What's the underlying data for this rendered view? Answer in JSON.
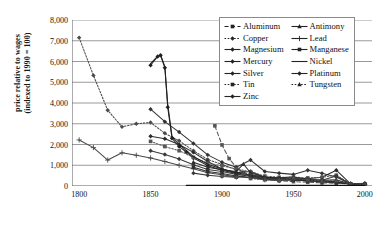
{
  "chart_data": {
    "type": "line",
    "title": "",
    "xlabel": "",
    "ylabel": "price relative to wages (indexed to 1990 = 100)",
    "ylabel_line1": "price relative to wages",
    "ylabel_line2": "(indexed to 1990 = 100)",
    "xlim": [
      1795,
      2005
    ],
    "ylim": [
      0,
      8000
    ],
    "xticks": [
      1800,
      1850,
      1900,
      1950,
      2000
    ],
    "xticklabels": [
      "1800",
      "1850",
      "1900",
      "1950",
      "2000"
    ],
    "yticks": [
      0,
      1000,
      2000,
      3000,
      4000,
      5000,
      6000,
      7000,
      8000
    ],
    "yticklabels": [
      "0",
      "1,000",
      "2,000",
      "3,000",
      "4,000",
      "5,000",
      "6,000",
      "7,000",
      "8,000"
    ],
    "grid": "horizontal",
    "legend_position": "upper-right-inside",
    "series": [
      {
        "name": "Aluminum",
        "marker": "square",
        "dash": "dashed",
        "color": "#555555",
        "x": [
          1895,
          1900,
          1905,
          1910,
          1915,
          1920,
          1930,
          1940,
          1950,
          1960,
          1970,
          1980,
          1990,
          2000
        ],
        "y": [
          2900,
          1980,
          1320,
          900,
          640,
          470,
          330,
          250,
          210,
          180,
          150,
          130,
          100,
          85
        ]
      },
      {
        "name": "Copper",
        "marker": "diamond",
        "dash": "dotted",
        "color": "#4a4a4a",
        "x": [
          1800,
          1810,
          1820,
          1830,
          1840,
          1850,
          1860,
          1870,
          1880,
          1890,
          1900,
          1910,
          1920,
          1930,
          1940,
          1950,
          1960,
          1970,
          1980,
          1990,
          2000
        ],
        "y": [
          7150,
          5330,
          3650,
          2850,
          3000,
          3060,
          2540,
          2180,
          1700,
          1280,
          1040,
          780,
          540,
          430,
          360,
          330,
          300,
          280,
          190,
          100,
          90
        ]
      },
      {
        "name": "Magnesium",
        "marker": "diamond",
        "dash": "solid",
        "color": "#222222",
        "x": [
          1850,
          1855,
          1857,
          1860,
          1862,
          1865,
          1870,
          1875,
          1880,
          1890,
          1900,
          1910,
          1920,
          1930,
          1940,
          1950,
          1960,
          1970,
          1980,
          1990,
          2000
        ],
        "y": [
          5820,
          6240,
          6300,
          5700,
          3800,
          2300,
          1900,
          1640,
          1350,
          980,
          760,
          600,
          480,
          400,
          330,
          290,
          250,
          210,
          170,
          100,
          95
        ]
      },
      {
        "name": "Mercury",
        "marker": "diamond",
        "dash": "solid",
        "color": "#333333",
        "x": [
          1850,
          1860,
          1870,
          1880,
          1890,
          1900,
          1910,
          1920,
          1930,
          1940,
          1950,
          1960,
          1970,
          1980,
          1990,
          2000
        ],
        "y": [
          3700,
          3100,
          2600,
          2050,
          1500,
          1150,
          900,
          1250,
          700,
          620,
          560,
          760,
          610,
          430,
          100,
          80
        ]
      },
      {
        "name": "Silver",
        "marker": "diamond",
        "dash": "solid",
        "color": "#2b2b2b",
        "x": [
          1850,
          1860,
          1870,
          1880,
          1890,
          1900,
          1910,
          1920,
          1930,
          1940,
          1950,
          1960,
          1970,
          1980,
          1990,
          2000
        ],
        "y": [
          2400,
          2280,
          2000,
          1620,
          1180,
          820,
          640,
          700,
          420,
          330,
          380,
          350,
          420,
          760,
          100,
          110
        ]
      },
      {
        "name": "Tin",
        "marker": "square",
        "dash": "dotted",
        "color": "#555555",
        "x": [
          1850,
          1860,
          1870,
          1880,
          1890,
          1900,
          1910,
          1920,
          1930,
          1940,
          1950,
          1960,
          1970,
          1980,
          1990,
          2000
        ],
        "y": [
          2150,
          1900,
          1700,
          1380,
          1100,
          980,
          820,
          690,
          480,
          420,
          430,
          390,
          420,
          520,
          100,
          70
        ]
      },
      {
        "name": "Zinc",
        "marker": "diamond",
        "dash": "solid",
        "color": "#3a3a3a",
        "x": [
          1850,
          1860,
          1870,
          1880,
          1890,
          1900,
          1910,
          1920,
          1930,
          1940,
          1950,
          1960,
          1970,
          1980,
          1990,
          2000
        ],
        "y": [
          1700,
          1520,
          1300,
          1020,
          800,
          700,
          560,
          500,
          330,
          300,
          330,
          270,
          230,
          200,
          100,
          85
        ]
      },
      {
        "name": "Antimony",
        "marker": "triangle",
        "dash": "solid",
        "color": "#2d2d2d",
        "x": [
          1880,
          1890,
          1900,
          1910,
          1915,
          1920,
          1930,
          1940,
          1950,
          1960,
          1970,
          1980,
          1990,
          2000
        ],
        "y": [
          1150,
          900,
          780,
          700,
          1050,
          640,
          420,
          400,
          430,
          330,
          280,
          300,
          100,
          75
        ]
      },
      {
        "name": "Lead",
        "marker": "plus",
        "dash": "solid",
        "color": "#4a4a4a",
        "x": [
          1800,
          1810,
          1820,
          1830,
          1840,
          1850,
          1860,
          1870,
          1880,
          1890,
          1900,
          1910,
          1920,
          1930,
          1940,
          1950,
          1960,
          1970,
          1980,
          1990,
          2000
        ],
        "y": [
          2220,
          1850,
          1250,
          1600,
          1480,
          1350,
          1180,
          1000,
          830,
          640,
          540,
          440,
          400,
          300,
          260,
          300,
          230,
          200,
          170,
          100,
          80
        ]
      },
      {
        "name": "Manganese",
        "marker": "square",
        "dash": "solid",
        "color": "#303030",
        "x": [
          1880,
          1890,
          1900,
          1910,
          1920,
          1930,
          1940,
          1950,
          1960,
          1970,
          1980,
          1990,
          2000
        ],
        "y": [
          900,
          700,
          600,
          480,
          420,
          330,
          290,
          290,
          250,
          210,
          180,
          100,
          80
        ]
      },
      {
        "name": "Nickel",
        "marker": "none",
        "dash": "solid",
        "color": "#222222",
        "x": [
          1850,
          1855,
          1857,
          1860,
          1862,
          1865,
          1870,
          1875,
          1880,
          1890,
          1900,
          1910,
          1920,
          1930,
          1940,
          1950,
          1960,
          1970,
          1980,
          1990,
          2000
        ],
        "y": [
          5900,
          6260,
          6320,
          5750,
          3950,
          2400,
          2000,
          1720,
          1420,
          1050,
          820,
          640,
          520,
          430,
          360,
          320,
          280,
          240,
          190,
          100,
          100
        ]
      },
      {
        "name": "Platinum",
        "marker": "diamond",
        "dash": "solid",
        "color": "#383838",
        "x": [
          1880,
          1890,
          1900,
          1910,
          1920,
          1930,
          1940,
          1950,
          1960,
          1970,
          1980,
          1990,
          2000
        ],
        "y": [
          620,
          520,
          460,
          420,
          560,
          380,
          320,
          330,
          300,
          280,
          480,
          100,
          130
        ]
      },
      {
        "name": "Tungsten",
        "marker": "triangle",
        "dash": "dotted",
        "color": "#4f4f4f",
        "x": [
          1900,
          1910,
          1915,
          1920,
          1930,
          1940,
          1950,
          1960,
          1970,
          1980,
          1990,
          2000
        ],
        "y": [
          500,
          420,
          620,
          360,
          300,
          280,
          400,
          300,
          240,
          260,
          100,
          70
        ]
      },
      {
        "name": "Baseline",
        "marker": "none",
        "dash": "solid",
        "color": "#111111",
        "x": [
          1875,
          1890,
          1900,
          1920,
          1940,
          1960,
          1980,
          2000
        ],
        "y": [
          30,
          30,
          30,
          30,
          30,
          30,
          30,
          30
        ]
      }
    ]
  },
  "legend": {
    "items": [
      {
        "label": "Aluminum",
        "marker": "square",
        "dash": "dashed"
      },
      {
        "label": "Antimony",
        "marker": "triangle",
        "dash": "solid"
      },
      {
        "label": "Copper",
        "marker": "diamond",
        "dash": "dotted"
      },
      {
        "label": "Lead",
        "marker": "plus",
        "dash": "solid"
      },
      {
        "label": "Magnesium",
        "marker": "diamond",
        "dash": "solid"
      },
      {
        "label": "Manganese",
        "marker": "square",
        "dash": "solid"
      },
      {
        "label": "Mercury",
        "marker": "diamond",
        "dash": "solid"
      },
      {
        "label": "Nickel",
        "marker": "none",
        "dash": "solid"
      },
      {
        "label": "Silver",
        "marker": "diamond",
        "dash": "solid"
      },
      {
        "label": "Platinum",
        "marker": "diamond",
        "dash": "solid"
      },
      {
        "label": "Tin",
        "marker": "square",
        "dash": "dotted"
      },
      {
        "label": "Tungsten",
        "marker": "triangle",
        "dash": "dotted"
      },
      {
        "label": "Zinc",
        "marker": "diamond",
        "dash": "solid"
      }
    ]
  },
  "colors": {
    "grid": "#8f8f8f",
    "axis": "#5a5a5a",
    "text": "#111111",
    "plot_bg": "#ffffff"
  }
}
